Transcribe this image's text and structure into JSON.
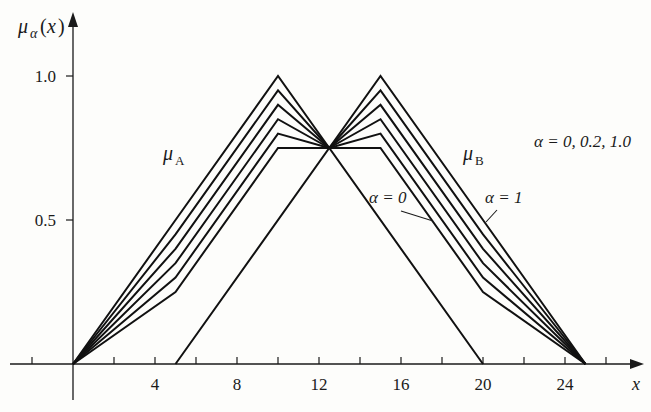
{
  "chart_data": {
    "type": "line",
    "title": "",
    "xlabel": "x",
    "ylabel": "μα(x)",
    "xlim": [
      -4,
      26
    ],
    "ylim": [
      0,
      1.05
    ],
    "grid": false,
    "x_ticks": [
      0,
      2,
      4,
      6,
      8,
      10,
      12,
      14,
      16,
      18,
      20,
      22,
      24,
      26
    ],
    "x_tick_labels": [
      "4",
      "8",
      "12",
      "16",
      "20",
      "24"
    ],
    "x_tick_label_values": [
      4,
      8,
      12,
      16,
      20,
      24
    ],
    "y_tick_labels": [
      "0.5",
      "1.0"
    ],
    "y_tick_label_values": [
      0.5,
      1.0
    ],
    "annotations": {
      "alpha_range": "α = 0, 0.2, 1.0",
      "alpha0": "α = 0",
      "alpha1": "α = 1",
      "mu_a": "μA",
      "mu_b": "μB"
    },
    "series": [
      {
        "name": "μA α=0",
        "x": [
          0,
          5,
          10,
          12.5
        ],
        "y": [
          0,
          0.25,
          0.75,
          0.75
        ]
      },
      {
        "name": "μA α=0.2",
        "x": [
          0,
          5,
          10,
          12.5
        ],
        "y": [
          0,
          0.3,
          0.8,
          0.75
        ]
      },
      {
        "name": "μA α=0.4",
        "x": [
          0,
          5,
          10,
          12.5
        ],
        "y": [
          0,
          0.35,
          0.85,
          0.75
        ]
      },
      {
        "name": "μA α=0.6",
        "x": [
          0,
          5,
          10,
          12.5
        ],
        "y": [
          0,
          0.4,
          0.9,
          0.75
        ]
      },
      {
        "name": "μA α=0.8",
        "x": [
          0,
          5,
          10,
          12.5
        ],
        "y": [
          0,
          0.45,
          0.95,
          0.75
        ]
      },
      {
        "name": "μA α=1.0",
        "x": [
          0,
          5,
          10,
          12.5
        ],
        "y": [
          0,
          0.5,
          1.0,
          0.75
        ]
      },
      {
        "name": "μB α=0",
        "x": [
          12.5,
          15,
          20,
          25
        ],
        "y": [
          0.75,
          0.75,
          0.25,
          0
        ]
      },
      {
        "name": "μB α=0.2",
        "x": [
          12.5,
          15,
          20,
          25
        ],
        "y": [
          0.75,
          0.8,
          0.3,
          0
        ]
      },
      {
        "name": "μB α=0.4",
        "x": [
          12.5,
          15,
          20,
          25
        ],
        "y": [
          0.75,
          0.85,
          0.35,
          0
        ]
      },
      {
        "name": "μB α=0.6",
        "x": [
          12.5,
          15,
          20,
          25
        ],
        "y": [
          0.75,
          0.9,
          0.4,
          0
        ]
      },
      {
        "name": "μB α=0.8",
        "x": [
          12.5,
          15,
          20,
          25
        ],
        "y": [
          0.75,
          0.95,
          0.45,
          0
        ]
      },
      {
        "name": "μB α=1.0",
        "x": [
          12.5,
          15,
          20,
          25
        ],
        "y": [
          0.75,
          1.0,
          0.5,
          0
        ]
      },
      {
        "name": "intersection triangle",
        "x": [
          5,
          12.5,
          20
        ],
        "y": [
          0,
          0.75,
          0
        ]
      }
    ]
  }
}
